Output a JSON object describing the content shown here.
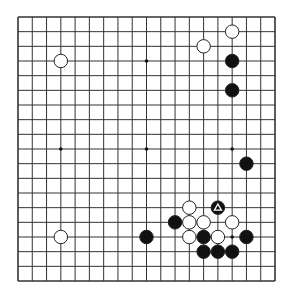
{
  "board": {
    "size": 19,
    "origin": {
      "x": 18,
      "y": 17
    },
    "end": {
      "x": 275,
      "y": 281
    },
    "line_color": "#333333",
    "background": "#ffffff",
    "star_points": [
      [
        3,
        3
      ],
      [
        9,
        3
      ],
      [
        15,
        3
      ],
      [
        3,
        9
      ],
      [
        9,
        9
      ],
      [
        15,
        9
      ],
      [
        3,
        15
      ],
      [
        9,
        15
      ],
      [
        15,
        15
      ]
    ]
  },
  "stones": [
    {
      "color": "white",
      "col": 3,
      "row": 3
    },
    {
      "color": "white",
      "col": 15,
      "row": 1
    },
    {
      "color": "white",
      "col": 13,
      "row": 2
    },
    {
      "color": "black",
      "col": 15,
      "row": 3
    },
    {
      "color": "black",
      "col": 15,
      "row": 5
    },
    {
      "color": "black",
      "col": 16,
      "row": 10
    },
    {
      "color": "white",
      "col": 3,
      "row": 15
    },
    {
      "color": "black",
      "col": 9,
      "row": 15
    },
    {
      "color": "black",
      "col": 11,
      "row": 14
    },
    {
      "color": "white",
      "col": 12,
      "row": 13
    },
    {
      "color": "black",
      "col": 14,
      "row": 13,
      "marker": "triangle"
    },
    {
      "color": "white",
      "col": 12,
      "row": 14
    },
    {
      "color": "white",
      "col": 13,
      "row": 14
    },
    {
      "color": "white",
      "col": 15,
      "row": 14
    },
    {
      "color": "white",
      "col": 12,
      "row": 15
    },
    {
      "color": "black",
      "col": 13,
      "row": 15
    },
    {
      "color": "white",
      "col": 14,
      "row": 15
    },
    {
      "color": "black",
      "col": 16,
      "row": 15
    },
    {
      "color": "black",
      "col": 13,
      "row": 16
    },
    {
      "color": "black",
      "col": 14,
      "row": 16
    },
    {
      "color": "black",
      "col": 15,
      "row": 16
    }
  ]
}
